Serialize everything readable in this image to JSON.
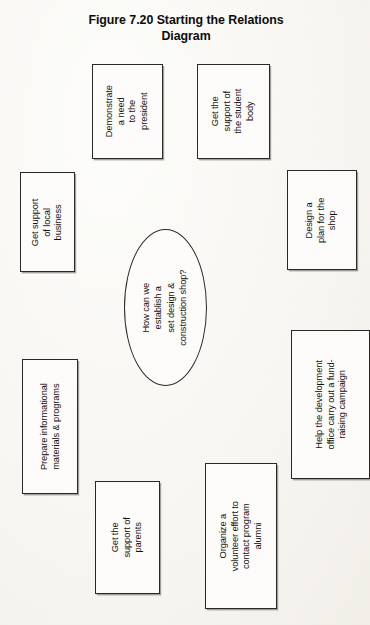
{
  "figure": {
    "title_line1": "Figure 7.20  Starting the Relations",
    "title_line2": "Diagram"
  },
  "diagram": {
    "type": "relations-diagram",
    "center": {
      "id": "central-question",
      "shape": "ellipse",
      "text_lines": [
        "How can we",
        "establish a",
        "set design &",
        "construction shop?"
      ]
    },
    "nodes": [
      {
        "id": "president",
        "shape": "rectangle",
        "text_lines": [
          "Demonstrate",
          "a need",
          "to the",
          "president"
        ]
      },
      {
        "id": "student-body",
        "shape": "rectangle",
        "text_lines": [
          "Get the",
          "support of",
          "the student",
          "body"
        ]
      },
      {
        "id": "local-business",
        "shape": "rectangle",
        "text_lines": [
          "Get support",
          "of local",
          "business"
        ]
      },
      {
        "id": "design-plan",
        "shape": "rectangle",
        "text_lines": [
          "Design a",
          "plan for the",
          "shop"
        ]
      },
      {
        "id": "materials",
        "shape": "rectangle",
        "text_lines": [
          "Prepare informational",
          "materials & programs"
        ]
      },
      {
        "id": "development",
        "shape": "rectangle",
        "text_lines": [
          "Help the development",
          "office carry out a fund-",
          "raising campaign"
        ]
      },
      {
        "id": "parents",
        "shape": "rectangle",
        "text_lines": [
          "Get the",
          "support of",
          "parents"
        ]
      },
      {
        "id": "alumni",
        "shape": "rectangle",
        "text_lines": [
          "Organize a",
          "volunteer effort to",
          "contact program",
          "alumni"
        ]
      }
    ],
    "colors": {
      "page_background": "#fbfaf7",
      "node_border": "#2b2724",
      "node_fill": "#fdfcfa",
      "text": "#14100d"
    }
  }
}
